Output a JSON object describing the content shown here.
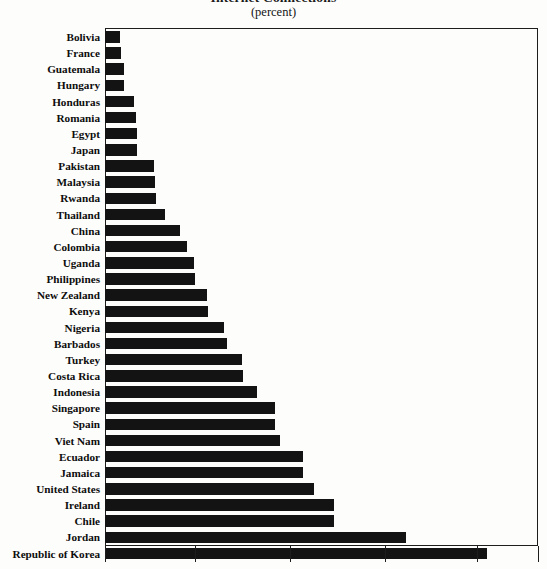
{
  "title": {
    "main": "Internet Connections",
    "sub": "(percent)"
  },
  "axis": {
    "tick_positions_px": [
      105,
      195,
      290,
      385,
      477
    ],
    "tick_labels": [
      "0",
      "10",
      "20",
      "30",
      "40"
    ],
    "show_tick_labels": false,
    "plot_left_px": 105,
    "plot_right_px": 538,
    "plot_top_px": 28,
    "plot_bottom_px": 546
  },
  "chart_data": {
    "type": "bar",
    "orientation": "horizontal",
    "title": "Internet Connections",
    "subtitle": "(percent)",
    "xlabel": "",
    "ylabel": "",
    "xlim": [
      0,
      48
    ],
    "grid": false,
    "legend": null,
    "bar_color": "#131313",
    "categories": [
      "Bolivia",
      "France",
      "Guatemala",
      "Hungary",
      "Honduras",
      "Romania",
      "Egypt",
      "Japan",
      "Pakistan",
      "Malaysia",
      "Rwanda",
      "Thailand",
      "China",
      "Colombia",
      "Uganda",
      "Philippines",
      "New Zealand",
      "Kenya",
      "Nigeria",
      "Barbados",
      "Turkey",
      "Costa Rica",
      "Indonesia",
      "Singapore",
      "Spain",
      "Viet Nam",
      "Ecuador",
      "Jamaica",
      "United States",
      "Ireland",
      "Chile",
      "Jordan",
      "Republic of Korea"
    ],
    "values": [
      1.6,
      1.7,
      2.0,
      2.0,
      3.1,
      3.3,
      3.4,
      3.4,
      5.3,
      5.4,
      5.5,
      6.5,
      8.1,
      8.8,
      9.6,
      9.7,
      11.0,
      11.1,
      12.8,
      13.1,
      14.7,
      14.8,
      16.4,
      18.4,
      18.4,
      19.0,
      21.4,
      21.4,
      22.6,
      24.7,
      24.7,
      32.5,
      41.2
    ],
    "bar_end_px": [
      120,
      121,
      124,
      124,
      134,
      136,
      137,
      137,
      154,
      155,
      156,
      165,
      180,
      187,
      194,
      195,
      207,
      208,
      224,
      227,
      242,
      243,
      257,
      275,
      275,
      280,
      303,
      303,
      314,
      334,
      334,
      406,
      487
    ]
  }
}
